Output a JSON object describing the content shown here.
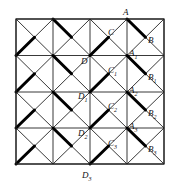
{
  "figure": {
    "type": "geometry grid diagram",
    "grid": {
      "rows": 4,
      "cols": 4,
      "x_lines": [
        16,
        53,
        90,
        127,
        164
      ],
      "y_lines": [
        19,
        55.5,
        92,
        128,
        164
      ]
    },
    "thick_segments_description": "In each cell, a half-diagonal is drawn thick: columns 1 and 3 use bottom-left to center, columns 2 and 4 use top-left to center",
    "labels": [
      {
        "id": "A",
        "text": "A",
        "sub": "",
        "x": 123,
        "y": 15
      },
      {
        "id": "B",
        "text": "B",
        "sub": "",
        "x": 148,
        "y": 43
      },
      {
        "id": "C",
        "text": "C",
        "sub": "",
        "x": 108,
        "y": 35
      },
      {
        "id": "D",
        "text": "D",
        "sub": "",
        "x": 81,
        "y": 64
      },
      {
        "id": "A1",
        "text": "A",
        "sub": "1",
        "x": 129,
        "y": 56
      },
      {
        "id": "B1",
        "text": "B",
        "sub": "1",
        "x": 148,
        "y": 80
      },
      {
        "id": "C1",
        "text": "C",
        "sub": "1",
        "x": 108,
        "y": 73
      },
      {
        "id": "D1",
        "text": "D",
        "sub": "1",
        "x": 78,
        "y": 99
      },
      {
        "id": "A2",
        "text": "A",
        "sub": "2",
        "x": 129,
        "y": 93
      },
      {
        "id": "B2",
        "text": "B",
        "sub": "2",
        "x": 148,
        "y": 116
      },
      {
        "id": "C2",
        "text": "C",
        "sub": "2",
        "x": 108,
        "y": 109
      },
      {
        "id": "D2",
        "text": "D",
        "sub": "2",
        "x": 78,
        "y": 136
      },
      {
        "id": "A3",
        "text": "A",
        "sub": "3",
        "x": 129,
        "y": 129
      },
      {
        "id": "B3",
        "text": "B",
        "sub": "3",
        "x": 148,
        "y": 152
      },
      {
        "id": "C3",
        "text": "C",
        "sub": "3",
        "x": 108,
        "y": 146
      },
      {
        "id": "D3",
        "text": "D",
        "sub": "3",
        "x": 82,
        "y": 178
      }
    ]
  }
}
